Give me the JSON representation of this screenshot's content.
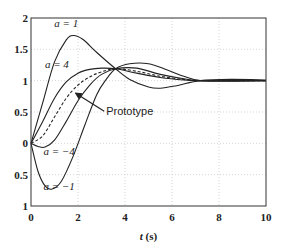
{
  "chart_data": {
    "type": "line",
    "title": "",
    "xlabel": "t (s)",
    "ylabel": "",
    "xlim": [
      0,
      10
    ],
    "ylim": [
      -1,
      2
    ],
    "grid": true,
    "x_ticks": [
      "0",
      "2",
      "4",
      "6",
      "8",
      "10"
    ],
    "y_ticks": [
      "2",
      "1.5",
      "1",
      "0.5",
      "0",
      "0.5",
      "1"
    ],
    "y_tick_values": [
      2,
      1.5,
      1,
      0.5,
      0,
      -0.5,
      -1
    ],
    "annotations": [
      {
        "text": "a = 1",
        "x": 1.5,
        "y": 1.85
      },
      {
        "text": "a = 4",
        "x": 1.1,
        "y": 1.2
      },
      {
        "text": "Prototype",
        "x": 3.2,
        "y": 0.45,
        "arrow_to": [
          1.9,
          0.8
        ]
      },
      {
        "text": "a = −4",
        "x": 1.2,
        "y": -0.18
      },
      {
        "text": "a = −1",
        "x": 1.2,
        "y": -0.75
      }
    ],
    "series": [
      {
        "name": "a = 1",
        "style": "solid",
        "x": [
          0,
          0.5,
          1,
          1.5,
          1.8,
          2.2,
          2.8,
          3.6,
          4.2,
          5,
          5.5,
          6.2,
          7.2,
          8.5,
          10
        ],
        "y": [
          0,
          0.65,
          1.3,
          1.65,
          1.72,
          1.66,
          1.45,
          1.19,
          1.02,
          0.9,
          0.88,
          0.92,
          1.0,
          1.02,
          1.01
        ]
      },
      {
        "name": "a = 4",
        "style": "solid",
        "x": [
          0,
          0.5,
          1,
          1.5,
          2,
          2.5,
          3,
          3.6,
          4.5,
          5.5,
          6.5,
          7.2,
          8.5,
          10
        ],
        "y": [
          0,
          0.35,
          0.72,
          0.98,
          1.12,
          1.18,
          1.2,
          1.19,
          1.12,
          1.05,
          1.01,
          1.0,
          1.0,
          1.0
        ]
      },
      {
        "name": "Prototype",
        "style": "dashed",
        "x": [
          0,
          0.5,
          1,
          1.5,
          2,
          2.5,
          3,
          3.6,
          4.5,
          5.5,
          6.5,
          7.2,
          8.5,
          10
        ],
        "y": [
          0,
          0.12,
          0.42,
          0.72,
          0.93,
          1.06,
          1.14,
          1.19,
          1.15,
          1.07,
          1.02,
          1.0,
          1.0,
          1.0
        ]
      },
      {
        "name": "a = −4",
        "style": "solid",
        "x": [
          0,
          0.3,
          0.6,
          1,
          1.5,
          2,
          2.5,
          3,
          3.6,
          4.5,
          5.5,
          6.5,
          7.2,
          8.5,
          10
        ],
        "y": [
          0,
          -0.05,
          -0.06,
          0.05,
          0.35,
          0.68,
          0.93,
          1.1,
          1.19,
          1.2,
          1.1,
          1.03,
          1.0,
          1.0,
          1.0
        ]
      },
      {
        "name": "a = −1",
        "style": "solid",
        "x": [
          0,
          0.3,
          0.6,
          0.9,
          1.3,
          1.8,
          2.3,
          2.8,
          3.2,
          3.6,
          4.2,
          5,
          5.8,
          6.5,
          7.2,
          8.5,
          10
        ],
        "y": [
          0,
          -0.45,
          -0.68,
          -0.73,
          -0.6,
          -0.2,
          0.3,
          0.78,
          1.02,
          1.19,
          1.27,
          1.27,
          1.17,
          1.07,
          1.0,
          0.99,
          1.0
        ]
      }
    ]
  }
}
